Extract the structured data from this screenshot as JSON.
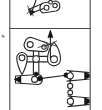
{
  "figure": {
    "kind": "diagram",
    "style": "patent-style line art",
    "background_color": "#ffffff",
    "line_color": "#2b2b2b",
    "frame_color": "#4a4a4a",
    "joint_fill_open": "#ffffff",
    "joint_fill_solid": "#111111",
    "frame": {
      "left": 9.5,
      "top": 0,
      "right": 90.5,
      "bottom": 110,
      "divider_y": 28.5
    },
    "panels": [
      {
        "name": "upper-panel",
        "label": "",
        "clipped": true,
        "content_description": "Partial cropped linkage: slender arm with teardrop end and a rounded two-hole link, plus a short arrow spike"
      },
      {
        "name": "lower-panel",
        "label": "",
        "clipped": false,
        "content_description": "Cross-shaped central hub with four radiating arms, rounded two-hole links, pendant teardrop member, and two arrow-tipped output levers at right"
      }
    ],
    "components": [
      {
        "name": "central-hub",
        "type": "cross-hub",
        "x": 36,
        "y": 59
      },
      {
        "name": "upper-rounded-link",
        "type": "two-hole-link",
        "x": 34,
        "y": 46
      },
      {
        "name": "left-teardrop-link",
        "type": "teardrop-link",
        "x": 22,
        "y": 61
      },
      {
        "name": "right-teardrop-link",
        "type": "teardrop-link",
        "x": 54,
        "y": 55
      },
      {
        "name": "vertical-spike",
        "type": "arrow-spike",
        "x": 50,
        "y": 38
      },
      {
        "name": "lower-left-lever",
        "type": "arrow-lever",
        "x": 24,
        "y": 80
      },
      {
        "name": "coupler-bar",
        "type": "link-bar",
        "x": 48,
        "y": 79
      },
      {
        "name": "upper-right-arrow-lever",
        "type": "arrow-lever",
        "x": 76,
        "y": 76
      },
      {
        "name": "lower-right-arrow-lever",
        "type": "arrow-lever",
        "x": 76,
        "y": 101
      },
      {
        "name": "left-edge-tick",
        "type": "tick-mark",
        "x": 3,
        "y": 36
      }
    ],
    "joint_count_open": 12,
    "joint_count_solid": 3
  }
}
